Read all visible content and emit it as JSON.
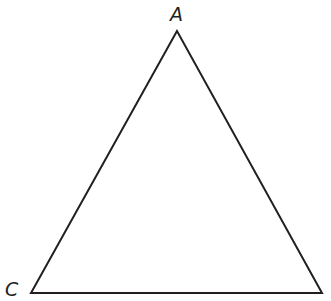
{
  "diagram": {
    "type": "triangle",
    "stroke_color": "#231f20",
    "stroke_width": 2,
    "vertices": [
      {
        "id": "A",
        "label": "A",
        "x": 177,
        "y": 31
      },
      {
        "id": "C",
        "label": "C",
        "x": 31,
        "y": 293
      },
      {
        "id": "B",
        "label": "",
        "x": 322,
        "y": 293
      }
    ],
    "labels": {
      "apex": "A",
      "bottom_left": "C"
    }
  }
}
